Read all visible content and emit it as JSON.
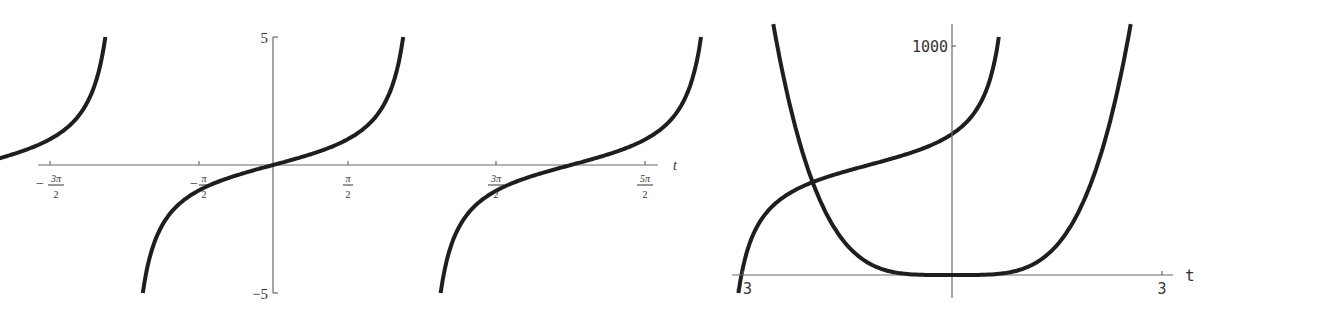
{
  "chart_data": [
    {
      "type": "line",
      "title": "",
      "function_shape": "tangent",
      "xlabel": "t",
      "ylabel": "",
      "xlim": [
        -4.9,
        8.2
      ],
      "ylim": [
        -5,
        5
      ],
      "x_ticks": [
        {
          "value": -4.712,
          "num": "3π",
          "den": "2",
          "neg": true
        },
        {
          "value": -1.571,
          "num": "π",
          "den": "2",
          "neg": true
        },
        {
          "value": 1.571,
          "num": "π",
          "den": "2",
          "neg": false
        },
        {
          "value": 4.712,
          "num": "3π",
          "den": "2",
          "neg": false
        },
        {
          "value": 7.854,
          "num": "5π",
          "den": "2",
          "neg": false
        }
      ],
      "y_ticks": [
        {
          "value": 5,
          "label": "5"
        },
        {
          "value": -5,
          "label": "-5"
        }
      ],
      "series": [
        {
          "name": "branch 1",
          "x": [
            -4.51,
            -4.2,
            -3.8,
            -3.14,
            -2.5,
            -2.0,
            -1.77
          ],
          "y": [
            -5,
            -1.8,
            -0.77,
            0,
            0.75,
            2.19,
            5
          ]
        },
        {
          "name": "branch 2",
          "x": [
            -1.37,
            -1.0,
            -0.5,
            0,
            0.5,
            1.0,
            1.37
          ],
          "y": [
            -5,
            -1.56,
            -0.55,
            0,
            0.55,
            1.56,
            5
          ]
        },
        {
          "name": "branch 3",
          "x": [
            1.77,
            2.14,
            2.64,
            3.14,
            3.64,
            4.14,
            4.51
          ],
          "y": [
            -5,
            -1.56,
            -0.55,
            0,
            0.55,
            1.56,
            5
          ]
        },
        {
          "name": "branch 4",
          "x": [
            4.91,
            5.28,
            5.78,
            6.28,
            6.78,
            7.28,
            7.65
          ],
          "y": [
            -5,
            -1.56,
            -0.55,
            0,
            0.55,
            1.56,
            5
          ]
        }
      ]
    },
    {
      "type": "line",
      "title": "",
      "xlabel": "t",
      "ylabel": "",
      "xlim": [
        -3.1,
        3.2
      ],
      "ylim": [
        0,
        1100
      ],
      "x_ticks": [
        {
          "value": -3,
          "label": "-3"
        },
        {
          "value": 3,
          "label": "3"
        }
      ],
      "y_ticks": [
        {
          "value": 1000,
          "label": "1000"
        }
      ],
      "series": [
        {
          "name": "curve",
          "x": [
            -2.56,
            -2.3,
            -2.1,
            -1.8,
            -1.5,
            -1.0,
            -0.5,
            0,
            0.5,
            1.0,
            1.5,
            1.8,
            2.1,
            2.3,
            2.56
          ],
          "y": [
            1096,
            712,
            496,
            268,
            129,
            25.5,
            1.6,
            0,
            1.6,
            25.5,
            129,
            268,
            496,
            712,
            1096
          ]
        }
      ]
    }
  ],
  "left_plot": {
    "x_axis_label": "t",
    "y_tick_top": "5",
    "y_tick_bottom": "−5",
    "ticks": [
      {
        "neg": "−",
        "num": "3π",
        "den": "2"
      },
      {
        "neg": "−",
        "num": "π",
        "den": "2"
      },
      {
        "neg": "",
        "num": "π",
        "den": "2"
      },
      {
        "neg": "",
        "num": "3π",
        "den": "2"
      },
      {
        "neg": "",
        "num": "5π",
        "den": "2"
      }
    ]
  },
  "right_plot": {
    "x_axis_label": "t",
    "y_tick": "1000",
    "x_tick_left": "-3",
    "x_tick_right": "3"
  }
}
